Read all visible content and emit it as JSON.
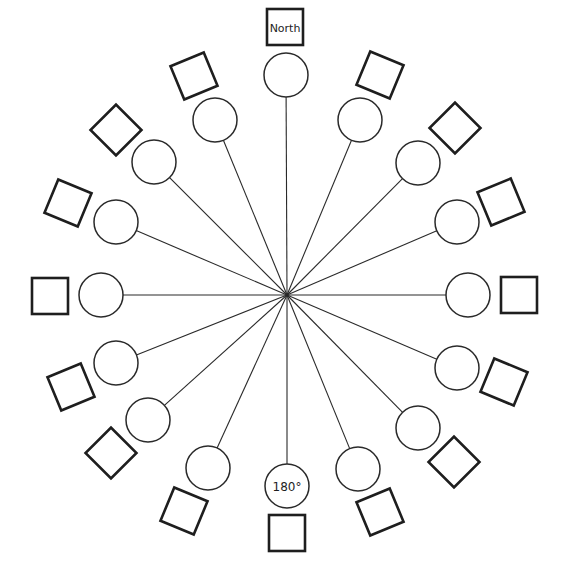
{
  "diagram": {
    "title": "",
    "center": {
      "x": 287,
      "y": 295
    },
    "circle_radius": 22,
    "square_size": 36,
    "labels": {
      "north": "North",
      "south": "180°"
    },
    "spokes": [
      {
        "angle": 0,
        "circle": {
          "x": 286,
          "y": 75
        },
        "square": {
          "x": 285,
          "y": 27,
          "rot": 0
        },
        "square_label": "North",
        "circle_label": ""
      },
      {
        "angle": 22.5,
        "circle": {
          "x": 360,
          "y": 120
        },
        "square": {
          "x": 380,
          "y": 75,
          "rot": 22.5
        },
        "square_label": "",
        "circle_label": ""
      },
      {
        "angle": 45,
        "circle": {
          "x": 418,
          "y": 163
        },
        "square": {
          "x": 455,
          "y": 128,
          "rot": 45
        },
        "square_label": "",
        "circle_label": ""
      },
      {
        "angle": 67.5,
        "circle": {
          "x": 457,
          "y": 222
        },
        "square": {
          "x": 501,
          "y": 202,
          "rot": 67.5
        },
        "square_label": "",
        "circle_label": ""
      },
      {
        "angle": 90,
        "circle": {
          "x": 468,
          "y": 295
        },
        "square": {
          "x": 519,
          "y": 295,
          "rot": 0
        },
        "square_label": "",
        "circle_label": ""
      },
      {
        "angle": 112.5,
        "circle": {
          "x": 457,
          "y": 368
        },
        "square": {
          "x": 504,
          "y": 382,
          "rot": 22.5
        },
        "square_label": "",
        "circle_label": ""
      },
      {
        "angle": 135,
        "circle": {
          "x": 418,
          "y": 428
        },
        "square": {
          "x": 454,
          "y": 462,
          "rot": 45
        },
        "square_label": "",
        "circle_label": ""
      },
      {
        "angle": 157.5,
        "circle": {
          "x": 358,
          "y": 469
        },
        "square": {
          "x": 380,
          "y": 512,
          "rot": 67.5
        },
        "square_label": "",
        "circle_label": ""
      },
      {
        "angle": 180,
        "circle": {
          "x": 287,
          "y": 486
        },
        "square": {
          "x": 287,
          "y": 533,
          "rot": 0
        },
        "square_label": "",
        "circle_label": "180°"
      },
      {
        "angle": 202.5,
        "circle": {
          "x": 208,
          "y": 468
        },
        "square": {
          "x": 184,
          "y": 511,
          "rot": 22.5
        },
        "square_label": "",
        "circle_label": ""
      },
      {
        "angle": 225,
        "circle": {
          "x": 148,
          "y": 420
        },
        "square": {
          "x": 111,
          "y": 453,
          "rot": 45
        },
        "square_label": "",
        "circle_label": ""
      },
      {
        "angle": 247.5,
        "circle": {
          "x": 116,
          "y": 363
        },
        "square": {
          "x": 71,
          "y": 387,
          "rot": 67.5
        },
        "square_label": "",
        "circle_label": ""
      },
      {
        "angle": 270,
        "circle": {
          "x": 101,
          "y": 295
        },
        "square": {
          "x": 50,
          "y": 296,
          "rot": 0
        },
        "square_label": "",
        "circle_label": ""
      },
      {
        "angle": 292.5,
        "circle": {
          "x": 116,
          "y": 222
        },
        "square": {
          "x": 68,
          "y": 203,
          "rot": 22.5
        },
        "square_label": "",
        "circle_label": ""
      },
      {
        "angle": 315,
        "circle": {
          "x": 154,
          "y": 162
        },
        "square": {
          "x": 116,
          "y": 130,
          "rot": 45
        },
        "square_label": "",
        "circle_label": ""
      },
      {
        "angle": 337.5,
        "circle": {
          "x": 215,
          "y": 120
        },
        "square": {
          "x": 194,
          "y": 76,
          "rot": 67.5
        },
        "square_label": "",
        "circle_label": ""
      }
    ]
  }
}
